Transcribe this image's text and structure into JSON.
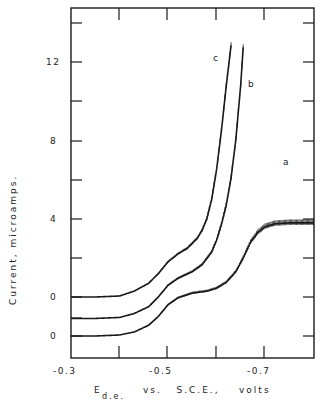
{
  "chart_data": {
    "type": "line",
    "title": "",
    "xlabel": "E d.e. vs. S.C.E., volts",
    "xlabel_parts": {
      "main": "E",
      "subscript": "d.e.",
      "rest": "vs.  S.C.E.,  volts"
    },
    "ylabel": "Current,  microamps.",
    "xlim": [
      -0.3,
      -0.8
    ],
    "ylim": [
      -0.8,
      14.8
    ],
    "x_ticks": [
      -0.3,
      -0.4,
      -0.5,
      -0.6,
      -0.7,
      -0.8
    ],
    "x_tick_labels": [
      {
        "value": -0.3,
        "label": "-0.3"
      },
      {
        "value": -0.5,
        "label": "-0.5"
      },
      {
        "value": -0.7,
        "label": "-0.7"
      }
    ],
    "y_ticks": [
      0,
      2,
      4,
      6,
      8,
      10,
      12,
      14
    ],
    "y_tick_labels": [
      {
        "value": 12,
        "label": "12"
      },
      {
        "value": 8,
        "label": "8"
      },
      {
        "value": 4,
        "label": "4"
      },
      {
        "value": 2,
        "label": "0",
        "note": "zero reference for curve c"
      },
      {
        "value": 0,
        "label": "0",
        "note": "zero reference for curve a"
      }
    ],
    "grid": false,
    "legend": "inline curve labels a, b, c",
    "series": [
      {
        "name": "a",
        "baseline_offset": 0,
        "x": [
          -0.3,
          -0.35,
          -0.4,
          -0.43,
          -0.46,
          -0.48,
          -0.5,
          -0.52,
          -0.55,
          -0.58,
          -0.6,
          -0.62,
          -0.64,
          -0.655,
          -0.67,
          -0.685,
          -0.7,
          -0.72,
          -0.75,
          -0.8
        ],
        "values": [
          0,
          0,
          0.05,
          0.2,
          0.55,
          1.0,
          1.6,
          1.95,
          2.2,
          2.3,
          2.45,
          2.75,
          3.3,
          4.0,
          4.8,
          5.3,
          5.6,
          5.75,
          5.8,
          5.8
        ]
      },
      {
        "name": "b",
        "baseline_offset": 0.9,
        "x": [
          -0.3,
          -0.35,
          -0.4,
          -0.43,
          -0.46,
          -0.48,
          -0.5,
          -0.52,
          -0.55,
          -0.57,
          -0.59,
          -0.6,
          -0.61,
          -0.62,
          -0.63,
          -0.64,
          -0.65,
          -0.655
        ],
        "values": [
          0,
          0,
          0.05,
          0.25,
          0.6,
          1.1,
          1.7,
          2.05,
          2.4,
          2.75,
          3.4,
          4.0,
          4.8,
          5.8,
          7.2,
          9.2,
          12.0,
          13.9
        ]
      },
      {
        "name": "c",
        "baseline_offset": 2.0,
        "x": [
          -0.3,
          -0.35,
          -0.4,
          -0.43,
          -0.46,
          -0.48,
          -0.5,
          -0.52,
          -0.54,
          -0.56,
          -0.57,
          -0.58,
          -0.59,
          -0.6,
          -0.61,
          -0.62,
          -0.63
        ],
        "values": [
          0,
          0,
          0.05,
          0.3,
          0.7,
          1.2,
          1.8,
          2.2,
          2.5,
          3.0,
          3.4,
          4.0,
          5.0,
          6.5,
          8.5,
          10.8,
          12.9
        ]
      }
    ],
    "annotations": [
      "a",
      "b",
      "c"
    ]
  },
  "labels": {
    "y_axis_title": "Current,   microamps.",
    "x_axis_main": "E",
    "x_axis_sub": "d.e.",
    "x_axis_rest": "vs.   S.C.E.,    volts",
    "curve_a": "a",
    "curve_b": "b",
    "curve_c": "c",
    "x_tick_03": "-0.3",
    "x_tick_05": "-0.5",
    "x_tick_07": "-0.7",
    "y_tick_12": "12",
    "y_tick_8": "8",
    "y_tick_4": "4",
    "y_tick_0_upper": "0",
    "y_tick_0_lower": "0"
  },
  "style": {
    "ink": "#1a1a1a",
    "background": "#ffffff"
  }
}
